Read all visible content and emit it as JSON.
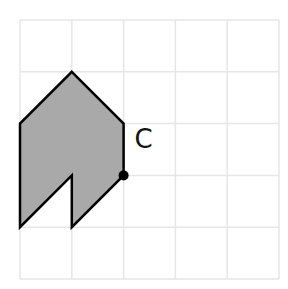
{
  "grid": {
    "origin_x": 20,
    "origin_y": 20,
    "cell": 51.8,
    "cols": 5,
    "rows": 5,
    "line_color": "#e6e6e6"
  },
  "shape": {
    "fill": "#a9a9a9",
    "stroke": "#000000",
    "vertices_grid": [
      [
        1,
        1
      ],
      [
        2,
        2
      ],
      [
        2,
        3
      ],
      [
        1,
        4
      ],
      [
        1,
        3
      ],
      [
        0,
        4
      ],
      [
        0,
        2
      ]
    ]
  },
  "point": {
    "label": "C",
    "grid": [
      2,
      3
    ]
  }
}
